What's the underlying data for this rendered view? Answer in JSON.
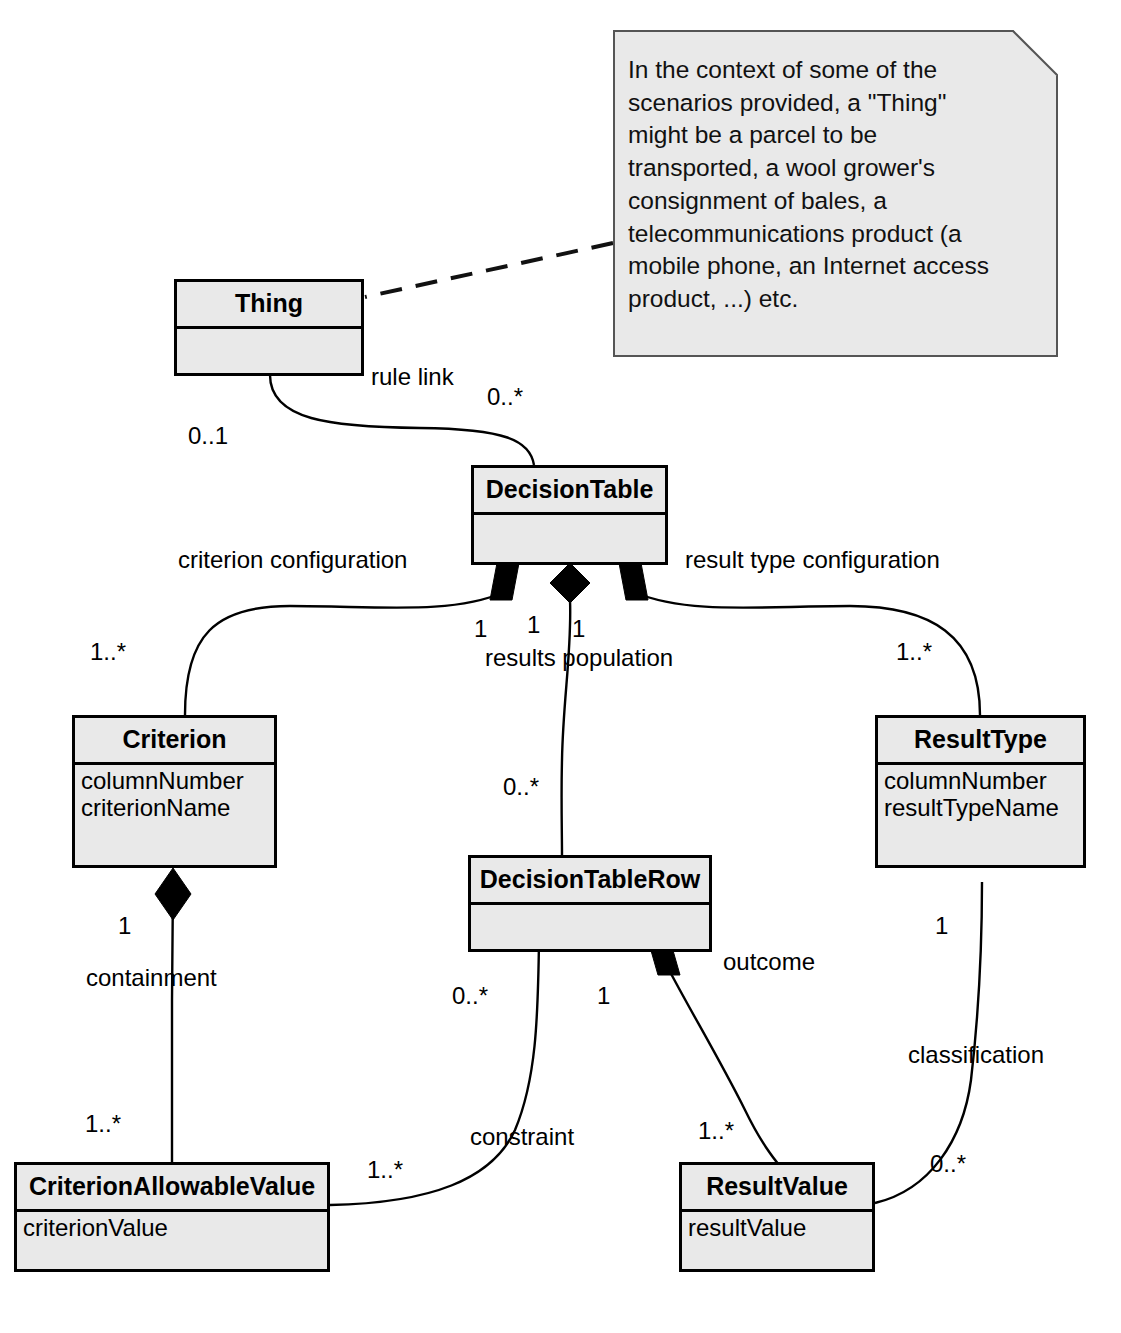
{
  "diagram": {
    "colors": {
      "class_fill": "#e9e9e9",
      "class_border": "#000000",
      "note_fill": "#e9e9e9",
      "note_border": "#555555",
      "line": "#000000",
      "background": "#ffffff"
    }
  },
  "note": {
    "text": "In the context of some of the scenarios provided, a \"Thing\" might be a parcel to be transported, a wool grower's consignment of bales, a telecommunications product (a mobile phone, an Internet access product, ...) etc."
  },
  "classes": {
    "thing": {
      "name": "Thing",
      "attributes": []
    },
    "decision_table": {
      "name": "DecisionTable",
      "attributes": []
    },
    "criterion": {
      "name": "Criterion",
      "attributes": [
        "columnNumber",
        "criterionName"
      ]
    },
    "result_type": {
      "name": "ResultType",
      "attributes": [
        "columnNumber",
        "resultTypeName"
      ]
    },
    "decision_table_row": {
      "name": "DecisionTableRow",
      "attributes": []
    },
    "criterion_allowable_value": {
      "name": "CriterionAllowableValue",
      "attributes": [
        "criterionValue"
      ]
    },
    "result_value": {
      "name": "ResultValue",
      "attributes": [
        "resultValue"
      ]
    }
  },
  "associations": {
    "rule_link": {
      "label": "rule link",
      "source_multiplicity": "0..1",
      "target_multiplicity": "0..*"
    },
    "criterion_configuration": {
      "label": "criterion configuration",
      "source_multiplicity": "1",
      "target_multiplicity": "1..*"
    },
    "results_population": {
      "label": "results population",
      "source_multiplicity": "1",
      "target_multiplicity": "0..*"
    },
    "result_type_configuration": {
      "label": "result type configuration",
      "source_multiplicity": "1",
      "target_multiplicity": "1..*"
    },
    "containment": {
      "label": "containment",
      "source_multiplicity": "1",
      "target_multiplicity": "1..*"
    },
    "constraint": {
      "label": "constraint",
      "source_multiplicity": "0..*",
      "target_multiplicity": "1..*"
    },
    "outcome": {
      "label": "outcome",
      "source_multiplicity": "1",
      "target_multiplicity": "1..*"
    },
    "classification": {
      "label": "classification",
      "source_multiplicity": "1",
      "target_multiplicity": "0..*"
    }
  }
}
